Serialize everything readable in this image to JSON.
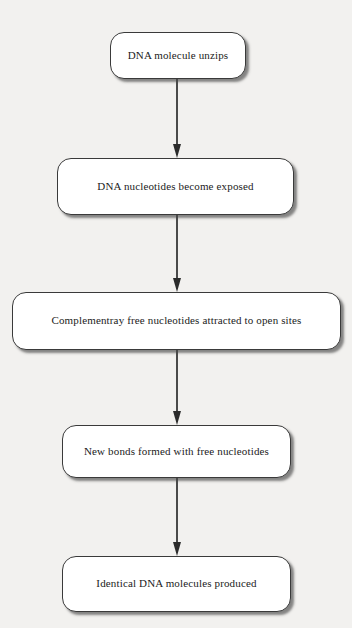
{
  "diagram": {
    "orientation": "vertical-top-to-bottom",
    "colors": {
      "page_background": "#f2f1ef",
      "node_fill": "#ffffff",
      "node_border": "#3a3a3a",
      "text": "#1b1b1b",
      "arrow": "#4a4a4a",
      "arrowhead": "#2b2b2b",
      "shadow": "rgba(40,40,40,0.55)"
    },
    "nodes": [
      {
        "id": "step-1",
        "label": "DNA molecule unzips"
      },
      {
        "id": "step-2",
        "label": "DNA nucleotides become exposed"
      },
      {
        "id": "step-3",
        "label": "Complementray free nucleotides attracted to open sites"
      },
      {
        "id": "step-4",
        "label": "New bonds formed with free nucleotides"
      },
      {
        "id": "step-5",
        "label": "Identical DNA molecules produced"
      }
    ],
    "connectors": [
      {
        "id": "arrow-1",
        "from": "step-1",
        "to": "step-2",
        "style": "solid-line-with-arrowhead"
      },
      {
        "id": "arrow-2",
        "from": "step-2",
        "to": "step-3",
        "style": "solid-line-with-arrowhead"
      },
      {
        "id": "arrow-3",
        "from": "step-3",
        "to": "step-4",
        "style": "solid-line-with-arrowhead"
      },
      {
        "id": "arrow-4",
        "from": "step-4",
        "to": "step-5",
        "style": "solid-line-with-arrowhead"
      }
    ]
  }
}
